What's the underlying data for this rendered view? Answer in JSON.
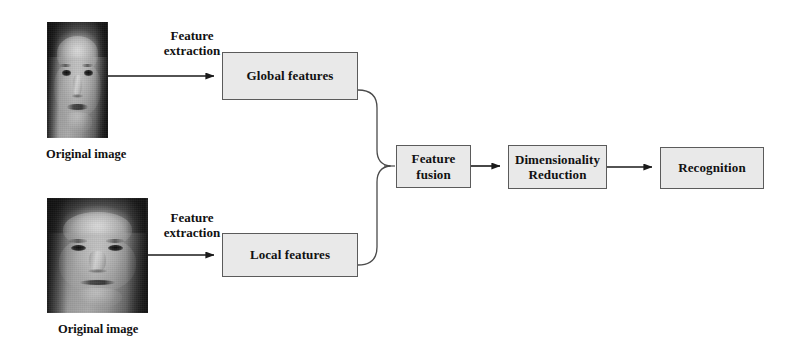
{
  "figure": {
    "type": "flowchart",
    "orientation": "left-to-right",
    "background_color": "#ffffff",
    "box_fill_color": "#e9e9e9",
    "box_border_color": "#5b5b5b",
    "line_color": "#1a1a1a",
    "text_color": "#111111"
  },
  "nodes": {
    "global_features": {
      "label": "Global features"
    },
    "local_features": {
      "label": "Local features"
    },
    "feature_fusion": {
      "label_line1": "Feature",
      "label_line2": "fusion"
    },
    "dimensionality_reduction": {
      "label_line1": "Dimensionality",
      "label_line2": "Reduction"
    },
    "recognition": {
      "label": "Recognition"
    }
  },
  "images": {
    "top": {
      "caption": "Original image",
      "alt": "grayscale frontal face photograph"
    },
    "bottom": {
      "caption": "Original image",
      "alt": "grayscale frontal face photograph"
    }
  },
  "edges": {
    "extraction_top": {
      "label_line1": "Feature",
      "label_line2": "extraction"
    },
    "extraction_bottom": {
      "label_line1": "Feature",
      "label_line2": "extraction"
    }
  }
}
